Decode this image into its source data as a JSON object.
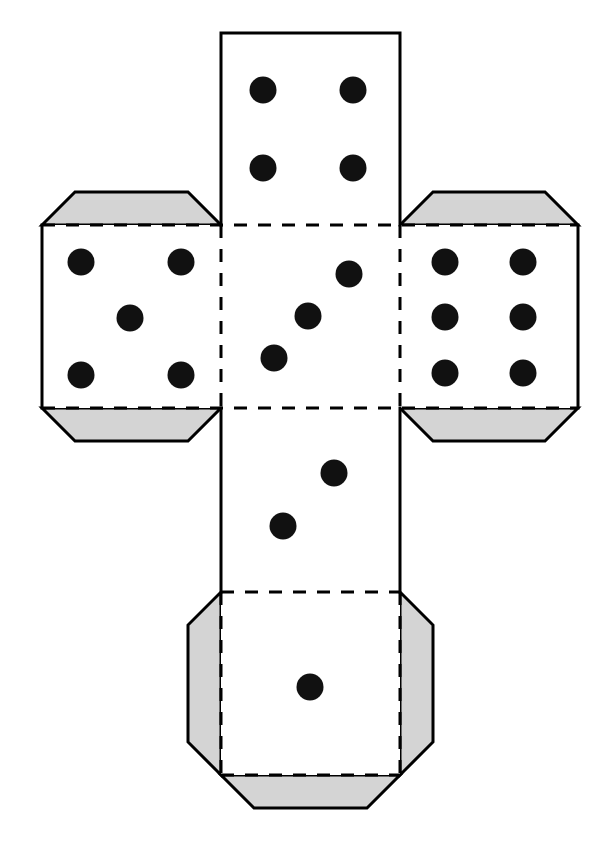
{
  "document": {
    "title": "Dice Net Cut-Out Template",
    "type": "cube-net-diagram",
    "background_color": "#ffffff",
    "ink_color": "#000000",
    "tab_fill_color": "#d4d4d4",
    "pip_color": "#111111",
    "canvas": {
      "width": 607,
      "height": 852
    }
  },
  "geometry": {
    "col_left": 42,
    "col_mid_left": 221,
    "col_mid_right": 400,
    "col_right": 578,
    "row_top": 33,
    "row_upper": 225,
    "row_lower": 408,
    "row_bottom2": 592,
    "row_bottom3": 775,
    "chamfer": 33,
    "tab_depth": 33,
    "pip_radius": 13.5,
    "stroke_width": 3,
    "dash_pattern": "13 11"
  },
  "net": {
    "description": "Flat cut-out net of a six-sided die arranged as a cross: one face on top, a row of three faces in the middle, and two faces stacked below the centre.",
    "faces": [
      {
        "name": "face-top",
        "value": 4,
        "position": "top",
        "rect": {
          "x": 221,
          "y": 33,
          "w": 179,
          "h": 192
        },
        "pips": [
          {
            "cx": 263,
            "cy": 90
          },
          {
            "cx": 353,
            "cy": 90
          },
          {
            "cx": 263,
            "cy": 168
          },
          {
            "cx": 353,
            "cy": 168
          }
        ]
      },
      {
        "name": "face-left",
        "value": 5,
        "position": "middle-left",
        "rect": {
          "x": 42,
          "y": 225,
          "w": 179,
          "h": 183
        },
        "pips": [
          {
            "cx": 81,
            "cy": 262
          },
          {
            "cx": 181,
            "cy": 262
          },
          {
            "cx": 130,
            "cy": 318
          },
          {
            "cx": 81,
            "cy": 375
          },
          {
            "cx": 181,
            "cy": 375
          }
        ]
      },
      {
        "name": "face-center",
        "value": 3,
        "position": "middle-center",
        "rect": {
          "x": 221,
          "y": 225,
          "w": 179,
          "h": 183
        },
        "pips": [
          {
            "cx": 349,
            "cy": 274
          },
          {
            "cx": 308,
            "cy": 316
          },
          {
            "cx": 274,
            "cy": 358
          }
        ]
      },
      {
        "name": "face-right",
        "value": 6,
        "position": "middle-right",
        "rect": {
          "x": 400,
          "y": 225,
          "w": 178,
          "h": 183
        },
        "pips": [
          {
            "cx": 445,
            "cy": 262
          },
          {
            "cx": 523,
            "cy": 262
          },
          {
            "cx": 445,
            "cy": 317
          },
          {
            "cx": 523,
            "cy": 317
          },
          {
            "cx": 445,
            "cy": 373
          },
          {
            "cx": 523,
            "cy": 373
          }
        ]
      },
      {
        "name": "face-lower",
        "value": 2,
        "position": "below-center",
        "rect": {
          "x": 221,
          "y": 408,
          "w": 179,
          "h": 184
        },
        "pips": [
          {
            "cx": 334,
            "cy": 473
          },
          {
            "cx": 283,
            "cy": 526
          }
        ]
      },
      {
        "name": "face-bottom",
        "value": 1,
        "position": "bottom",
        "rect": {
          "x": 221,
          "y": 592,
          "w": 179,
          "h": 183
        },
        "pips": [
          {
            "cx": 310,
            "cy": 687
          }
        ]
      }
    ],
    "tabs": [
      {
        "name": "tab-left-face-top",
        "side": "top",
        "attached_to": "face-left",
        "shape": "trapezoid-chamfered"
      },
      {
        "name": "tab-left-face-bottom",
        "side": "bottom",
        "attached_to": "face-left",
        "shape": "trapezoid-chamfered"
      },
      {
        "name": "tab-right-face-top",
        "side": "top",
        "attached_to": "face-right",
        "shape": "trapezoid-chamfered"
      },
      {
        "name": "tab-right-face-bottom",
        "side": "bottom",
        "attached_to": "face-right",
        "shape": "trapezoid-chamfered"
      },
      {
        "name": "tab-bottom-face-left",
        "side": "left",
        "attached_to": "face-bottom",
        "shape": "trapezoid-chamfered"
      },
      {
        "name": "tab-bottom-face-right",
        "side": "right",
        "attached_to": "face-bottom",
        "shape": "trapezoid-chamfered"
      },
      {
        "name": "tab-bottom-face-bottom",
        "side": "bottom",
        "attached_to": "face-bottom",
        "shape": "trapezoid-chamfered"
      }
    ],
    "fold_lines": [
      {
        "name": "fold-top-face-to-center",
        "from": [
          221,
          225
        ],
        "to": [
          400,
          225
        ]
      },
      {
        "name": "fold-center-to-left",
        "from": [
          221,
          225
        ],
        "to": [
          221,
          408
        ]
      },
      {
        "name": "fold-center-to-right",
        "from": [
          400,
          225
        ],
        "to": [
          400,
          408
        ]
      },
      {
        "name": "fold-center-to-lower",
        "from": [
          221,
          408
        ],
        "to": [
          400,
          408
        ]
      },
      {
        "name": "fold-lower-to-bottom",
        "from": [
          221,
          592
        ],
        "to": [
          400,
          592
        ]
      },
      {
        "name": "fold-bottom-to-tab",
        "from": [
          221,
          775
        ],
        "to": [
          400,
          775
        ]
      },
      {
        "name": "fold-left-tab-top",
        "from": [
          42,
          225
        ],
        "to": [
          221,
          225
        ]
      },
      {
        "name": "fold-left-tab-bottom",
        "from": [
          42,
          408
        ],
        "to": [
          221,
          408
        ]
      },
      {
        "name": "fold-right-tab-top",
        "from": [
          400,
          225
        ],
        "to": [
          578,
          225
        ]
      },
      {
        "name": "fold-right-tab-bottom",
        "from": [
          400,
          408
        ],
        "to": [
          578,
          408
        ]
      },
      {
        "name": "fold-bottom-left-tab",
        "from": [
          221,
          592
        ],
        "to": [
          221,
          775
        ]
      },
      {
        "name": "fold-bottom-right-tab",
        "from": [
          400,
          592
        ],
        "to": [
          400,
          775
        ]
      }
    ]
  }
}
